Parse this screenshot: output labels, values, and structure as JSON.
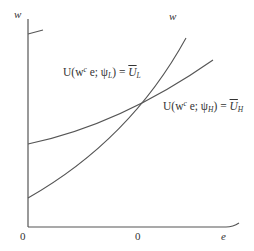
{
  "diagram": {
    "type": "indifference-curves",
    "axes": {
      "y_label_left": "w",
      "y_label_right": "w",
      "x_label": "e",
      "origin_left": "0",
      "origin_right": "0"
    },
    "curves": [
      {
        "id": "low-type",
        "label_prefix": "U(w",
        "label_sup": "c",
        "label_mid": " e; ψ",
        "label_sub": "L",
        "label_close": ") = ",
        "label_rhs": "U",
        "label_rhs_sub": "L",
        "shape": "convex-steep"
      },
      {
        "id": "high-type",
        "label_prefix": "U(w",
        "label_sup": "c",
        "label_mid": " e; ψ",
        "label_sub": "H",
        "label_close": ") = ",
        "label_rhs": "U",
        "label_rhs_sub": "H",
        "shape": "concave-flat"
      }
    ],
    "colors": {
      "line": "#555555",
      "text": "#333333",
      "background": "#ffffff"
    }
  }
}
